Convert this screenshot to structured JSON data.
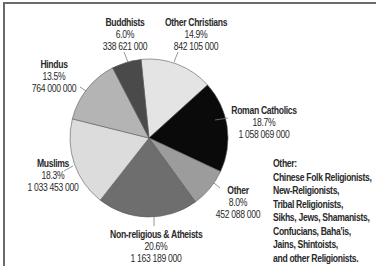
{
  "chart_data": {
    "type": "pie",
    "title": "",
    "start_angle_deg": -5.8,
    "direction": "clockwise",
    "center": [
      149,
      138
    ],
    "radius": 79,
    "slices": [
      {
        "label": "Other Christians",
        "percent": 14.9,
        "value": 842105000,
        "value_text": "842 105 000",
        "percent_text": "14.9%",
        "color": "#e4e4e4"
      },
      {
        "label": "Roman Catholics",
        "percent": 18.7,
        "value": 1058069000,
        "value_text": "1 058 069 000",
        "percent_text": "18.7%",
        "color": "#0a0a0a"
      },
      {
        "label": "Other",
        "percent": 8.0,
        "value": 452088000,
        "value_text": "452 088 000",
        "percent_text": "8.0%",
        "color": "#9c9c9c"
      },
      {
        "label": "Non-religious & Atheists",
        "percent": 20.6,
        "value": 1163189000,
        "value_text": "1 163 189 000",
        "percent_text": "20.6%",
        "color": "#6e6e6e"
      },
      {
        "label": "Muslims",
        "percent": 18.3,
        "value": 1033453000,
        "value_text": "1 033 453 000",
        "percent_text": "18.3%",
        "color": "#dcdcdc"
      },
      {
        "label": "Hindus",
        "percent": 13.5,
        "value": 764000000,
        "value_text": "764 000 000",
        "percent_text": "13.5%",
        "color": "#b4b4b4"
      },
      {
        "label": "Buddhists",
        "percent": 6.0,
        "value": 338621000,
        "value_text": "338 621 000",
        "percent_text": "6.0%",
        "color": "#4a4a4a"
      }
    ],
    "legend": {
      "position": "right-bottom",
      "title": "Other:",
      "lines": [
        "Chinese Folk Religionists,",
        "New-Religionists,",
        "Tribal Religionists,",
        "Sikhs, Jews, Shamanists,",
        "Confucians, Baha'is,",
        "Jains, Shintoists,",
        "and other Religionists."
      ]
    }
  },
  "labels": {
    "buddhists": {
      "name": "Buddhists",
      "pct": "6.0%",
      "val": "338 621 000"
    },
    "other_christians": {
      "name": "Other Christians",
      "pct": "14.9%",
      "val": "842 105 000"
    },
    "hindus": {
      "name": "Hindus",
      "pct": "13.5%",
      "val": "764 000 000"
    },
    "roman_catholics": {
      "name": "Roman Catholics",
      "pct": "18.7%",
      "val": "1 058 069 000"
    },
    "muslims": {
      "name": "Muslims",
      "pct": "18.3%",
      "val": "1 033 453 000"
    },
    "other": {
      "name": "Other",
      "pct": "8.0%",
      "val": "452 088 000"
    },
    "non_religious": {
      "name": "Non-religious & Atheists",
      "pct": "20.6%",
      "val": "1 163 189 000"
    }
  },
  "note": {
    "title": "Other:",
    "lines": [
      "Chinese Folk Religionists,",
      "New-Religionists,",
      "Tribal Religionists,",
      "Sikhs, Jews, Shamanists,",
      "Confucians, Baha'is,",
      "Jains, Shintoists,",
      "and other Religionists."
    ]
  }
}
